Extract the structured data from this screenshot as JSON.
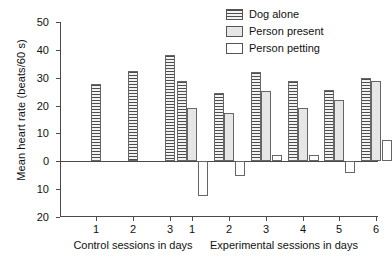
{
  "chart_data": {
    "type": "bar",
    "title": "",
    "xlabel": "",
    "ylabel": "Mean heart rate (beats/60 s)",
    "ylim": [
      -20,
      50
    ],
    "ytick_labels": [
      "50",
      "40",
      "30",
      "20",
      "10",
      "0",
      "10",
      "20"
    ],
    "ytick_values": [
      50,
      40,
      30,
      20,
      10,
      0,
      -10,
      -20
    ],
    "grid": false,
    "legend_position": "top-right",
    "groups": [
      {
        "name": "Control sessions in days",
        "axis_label": "Control sessions in days",
        "categories": [
          "1",
          "2",
          "3"
        ],
        "series": [
          {
            "name": "Dog alone",
            "values": [
              27.7,
              32.4,
              38.0
            ]
          },
          {
            "name": "Person present",
            "values": [
              null,
              null,
              null
            ]
          },
          {
            "name": "Person petting",
            "values": [
              null,
              null,
              null
            ]
          }
        ]
      },
      {
        "name": "Experimental sessions in days",
        "axis_label": "Experimental sessions in days",
        "categories": [
          "1",
          "2",
          "3",
          "4",
          "5",
          "6"
        ],
        "series": [
          {
            "name": "Dog alone",
            "values": [
              28.8,
              24.6,
              32.0,
              28.8,
              25.5,
              30.0
            ]
          },
          {
            "name": "Person present",
            "values": [
              19.1,
              17.2,
              25.4,
              19.3,
              22.0,
              29.0
            ]
          },
          {
            "name": "Person petting",
            "values": [
              -12.5,
              -5.3,
              2.4,
              2.1,
              -4.3,
              7.5
            ]
          }
        ]
      }
    ],
    "legend": [
      {
        "label": "Dog alone",
        "pattern": "horizontal-stripes",
        "color": "#d9d9d9"
      },
      {
        "label": "Person present",
        "pattern": "solid",
        "color": "#e6e6e6"
      },
      {
        "label": "Person petting",
        "pattern": "solid",
        "color": "#ffffff"
      }
    ]
  },
  "axis": {
    "ylabel": "Mean heart rate (beats/60 s)"
  }
}
